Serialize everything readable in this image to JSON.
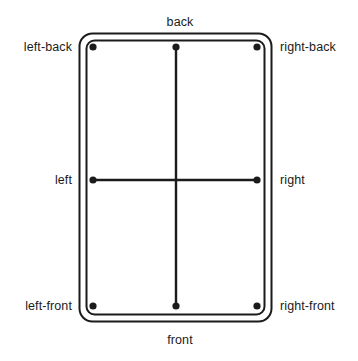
{
  "diagram": {
    "type": "orientation-reference-diagram",
    "colors": {
      "stroke": "#1b1b1b",
      "background": "#ffffff",
      "text": "#1b1b1b"
    },
    "labels": {
      "back": "back",
      "front": "front",
      "left": "left",
      "right": "right",
      "left_back": "left-back",
      "right_back": "right-back",
      "left_front": "left-front",
      "right_front": "right-front"
    },
    "points": [
      {
        "id": "left-back",
        "label": "left-back",
        "x": 93,
        "y": 47
      },
      {
        "id": "back",
        "label": "back",
        "x": 176,
        "y": 47
      },
      {
        "id": "right-back",
        "label": "right-back",
        "x": 257,
        "y": 47
      },
      {
        "id": "left",
        "label": "left",
        "x": 93,
        "y": 180
      },
      {
        "id": "right",
        "label": "right",
        "x": 257,
        "y": 180
      },
      {
        "id": "left-front",
        "label": "left-front",
        "x": 93,
        "y": 306
      },
      {
        "id": "front",
        "label": "front",
        "x": 176,
        "y": 306
      },
      {
        "id": "right-front",
        "label": "right-front",
        "x": 257,
        "y": 306
      }
    ],
    "connectors": [
      {
        "id": "vertical-axis",
        "from": "back",
        "to": "front"
      },
      {
        "id": "horizontal-axis",
        "from": "left",
        "to": "right"
      }
    ],
    "frame": {
      "outer": {
        "x": 79,
        "y": 33,
        "width": 193,
        "height": 289,
        "radius": 13
      },
      "inner": {
        "x": 86,
        "y": 40,
        "width": 179,
        "height": 275,
        "radius": 8
      }
    }
  }
}
